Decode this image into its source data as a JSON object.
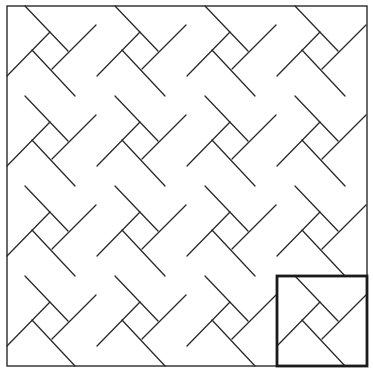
{
  "diagram": {
    "type": "quilt-pattern",
    "grid": {
      "rows": 4,
      "cols": 4
    },
    "origin": [
      7,
      6
    ],
    "block_size": 90,
    "line_color": "#2a2a2a",
    "background": "#ffffff",
    "block_lines": [
      [
        [
          18,
          0
        ],
        [
          61,
          45
        ]
      ],
      [
        [
          89,
          19
        ],
        [
          45,
          63
        ]
      ],
      [
        [
          0,
          70
        ],
        [
          43,
          26
        ]
      ],
      [
        [
          25,
          44
        ],
        [
          68,
          90
        ]
      ]
    ],
    "highlighted_block": {
      "row": 3,
      "col": 3,
      "stroke_width": 2.8
    }
  }
}
